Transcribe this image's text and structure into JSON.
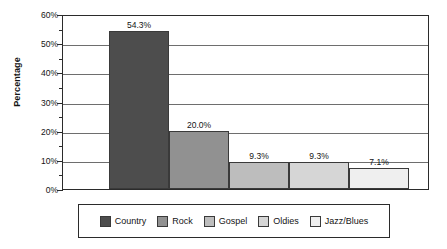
{
  "chart_data": {
    "type": "bar",
    "title": "",
    "subtitle": "",
    "xlabel": "",
    "ylabel": "Percentage",
    "categories": [
      "Country",
      "Rock",
      "Gospel",
      "Oldies",
      "Jazz/Blues"
    ],
    "values": [
      54.3,
      20.0,
      9.3,
      9.3,
      7.1
    ],
    "data_labels": [
      "54.3%",
      "20.0%",
      "9.3%",
      "9.3%",
      "7.1%"
    ],
    "ylim": [
      0,
      60
    ],
    "ytick_labels": [
      "0%",
      "10%",
      "20%",
      "30%",
      "40%",
      "50%",
      "60%"
    ],
    "ytick_values": [
      0,
      10,
      20,
      30,
      40,
      50,
      60
    ],
    "minor_tick_values": [
      5,
      15,
      25,
      35,
      45,
      55
    ],
    "grid": true,
    "grid_axis": "y",
    "legend": {
      "position": "bottom",
      "entries": [
        {
          "label": "Country",
          "color": "#4d4d4d"
        },
        {
          "label": "Rock",
          "color": "#919191"
        },
        {
          "label": "Gospel",
          "color": "#bdbdbd"
        },
        {
          "label": "Oldies",
          "color": "#d6d6d6"
        },
        {
          "label": "Jazz/Blues",
          "color": "#efefef"
        }
      ]
    },
    "series": [
      {
        "name": "Percentage",
        "values": [
          54.3,
          20.0,
          9.3,
          9.3,
          7.1
        ],
        "colors": [
          "#4d4d4d",
          "#919191",
          "#bdbdbd",
          "#d6d6d6",
          "#efefef"
        ]
      }
    ]
  },
  "colors": {
    "axis": "#2b2b2b",
    "gridline": "#6e6e6e",
    "text": "#141414",
    "background": "#ffffff",
    "bar_outline": "#3a3a3a"
  }
}
